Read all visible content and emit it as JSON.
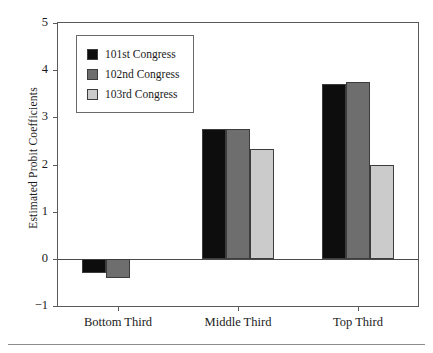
{
  "chart_data": {
    "type": "bar",
    "title": "",
    "xlabel": "",
    "ylabel": "Estimated Probit Coefficients",
    "categories": [
      "Bottom Third",
      "Middle Third",
      "Top Third"
    ],
    "ylim": [
      -1,
      5
    ],
    "yticks": [
      -1,
      0,
      1,
      2,
      3,
      4,
      5
    ],
    "ytick_labels": [
      "−1",
      "0",
      "1",
      "2",
      "3",
      "4",
      "5"
    ],
    "grid": false,
    "legend_position": "upper left",
    "zero_line": 0,
    "series": [
      {
        "name": "101st Congress",
        "color": "#0d0d0d",
        "swatch_class": "swatch-101",
        "values": [
          -0.29,
          2.76,
          3.7
        ]
      },
      {
        "name": "102nd Congress",
        "color": "#6e6e6e",
        "swatch_class": "swatch-102",
        "values": [
          -0.41,
          2.75,
          3.74
        ]
      },
      {
        "name": "103rd Congress",
        "color": "#cbcbcb",
        "swatch_class": "swatch-103",
        "values": [
          null,
          2.32,
          2.0
        ]
      }
    ]
  }
}
